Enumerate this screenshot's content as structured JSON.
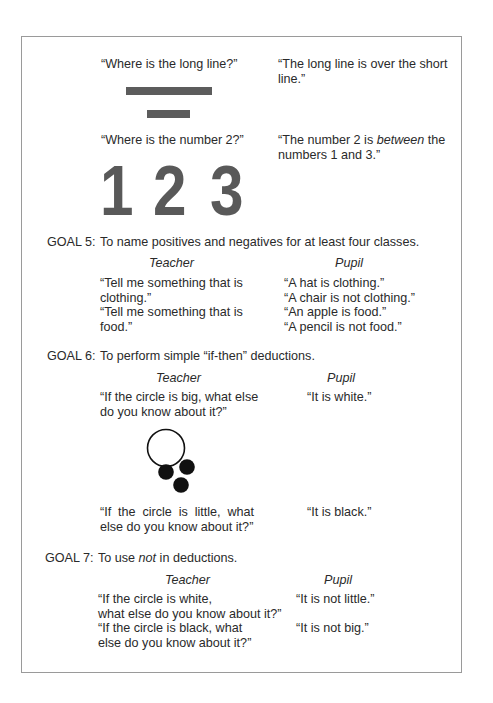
{
  "top": {
    "q1": "“Where is the long line?”",
    "a1_line1": "“The long line is over the short",
    "a1_line2": "line.”",
    "q2": "“Where is the number 2?”",
    "a2_line1_pre": "“The number 2 is ",
    "a2_line1_em": "between",
    "a2_line1_post": " the",
    "a2_line2": "numbers 1 and 3.”",
    "digits": [
      "1",
      "2",
      "3"
    ],
    "figure_lines": [
      "long-line",
      "short-line"
    ]
  },
  "goal5": {
    "label": "GOAL 5:",
    "text": "To name positives and negatives for at least four classes.",
    "teacher_header": "Teacher",
    "pupil_header": "Pupil",
    "teacher_lines": [
      "“Tell me something that is",
      "clothing.”",
      "“Tell me something that is",
      "food.”"
    ],
    "pupil_lines": [
      "“A hat is clothing.”",
      "“A chair is not clothing.”",
      "“An apple is food.”",
      "“A pencil is not food.”"
    ]
  },
  "goal6": {
    "label": "GOAL 6:",
    "text": "To perform simple “if-then” deductions.",
    "teacher_header": "Teacher",
    "pupil_header": "Pupil",
    "q1_lines": [
      "“If the circle is big, what else",
      "do you know about it?”"
    ],
    "a1": "“It is white.”",
    "q2_lines": [
      "“If the circle is little, what",
      "else do you know about it?”"
    ],
    "a2": "“It is black.”",
    "figure": "one large white circle above three small black circles"
  },
  "goal7": {
    "label": "GOAL 7:",
    "text_pre": "To use ",
    "text_em": "not",
    "text_post": " in deductions.",
    "teacher_header": "Teacher",
    "pupil_header": "Pupil",
    "q1_lines": [
      "“If the circle is white,",
      "what else do you know about it?”"
    ],
    "a1": "“It is not little.”",
    "q2_lines": [
      "“If the circle is black, what",
      "else do you know about it?”"
    ],
    "a2": "“It is not big.”"
  }
}
